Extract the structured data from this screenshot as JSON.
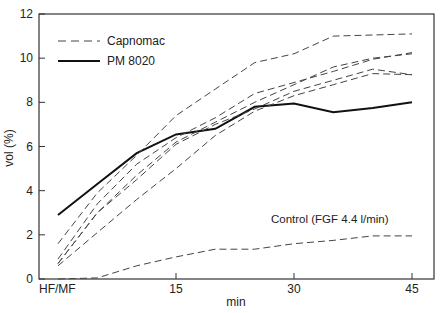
{
  "chart_data": {
    "type": "line",
    "title": "",
    "xlabel": "min",
    "ylabel": "vol (%)",
    "xlim": [
      0,
      46.5
    ],
    "ylim": [
      0,
      12
    ],
    "x_ticks": [
      {
        "value": 0,
        "label": "HF/MF"
      },
      {
        "value": 15,
        "label": "15"
      },
      {
        "value": 30,
        "label": "30"
      },
      {
        "value": 45,
        "label": "45"
      }
    ],
    "y_ticks": [
      0,
      2,
      4,
      6,
      8,
      10,
      12
    ],
    "grid": false,
    "legend": {
      "position": "upper left",
      "entries": [
        {
          "label": "Capnomac",
          "style": "dashed"
        },
        {
          "label": "PM 8020",
          "style": "solid"
        }
      ]
    },
    "annotations": [
      {
        "text": "Control (FGF 4.4 l/min)",
        "x": 33,
        "y": 2.7
      }
    ],
    "x": [
      0,
      5,
      10,
      15,
      20,
      25,
      30,
      35,
      40,
      45
    ],
    "series": [
      {
        "name": "PM 8020",
        "style": "solid",
        "values": [
          2.9,
          4.3,
          5.7,
          6.55,
          6.8,
          7.8,
          7.95,
          7.55,
          7.75,
          8.0
        ]
      },
      {
        "name": "Capnomac 1",
        "style": "dashed",
        "values": [
          1.6,
          3.9,
          5.6,
          7.4,
          8.6,
          9.8,
          10.2,
          11.0,
          11.05,
          11.1
        ]
      },
      {
        "name": "Capnomac 2",
        "style": "dashed",
        "values": [
          0.9,
          3.4,
          5.2,
          6.4,
          7.3,
          8.4,
          8.9,
          9.4,
          9.95,
          10.25
        ]
      },
      {
        "name": "Capnomac 3",
        "style": "dashed",
        "values": [
          0.7,
          3.0,
          4.7,
          6.2,
          7.1,
          8.0,
          8.8,
          9.6,
          10.0,
          10.2
        ]
      },
      {
        "name": "Capnomac 4",
        "style": "dashed",
        "values": [
          0.7,
          3.0,
          4.5,
          6.1,
          7.0,
          7.7,
          8.5,
          9.0,
          9.5,
          9.25
        ]
      },
      {
        "name": "Capnomac 5",
        "style": "dashed",
        "values": [
          0.6,
          2.1,
          3.6,
          5.0,
          6.5,
          7.6,
          8.3,
          8.8,
          9.3,
          9.25
        ]
      },
      {
        "name": "Control (FGF 4.4 l/min)",
        "style": "dashed",
        "values": [
          0.0,
          0.05,
          0.6,
          1.0,
          1.35,
          1.35,
          1.6,
          1.75,
          1.95,
          1.95
        ]
      }
    ]
  },
  "labels": {
    "ylabel": "vol (%)",
    "xlabel": "min",
    "legend_capnomac": "Capnomac",
    "legend_pm": "PM 8020",
    "annotation": "Control (FGF 4.4 l/min)"
  }
}
